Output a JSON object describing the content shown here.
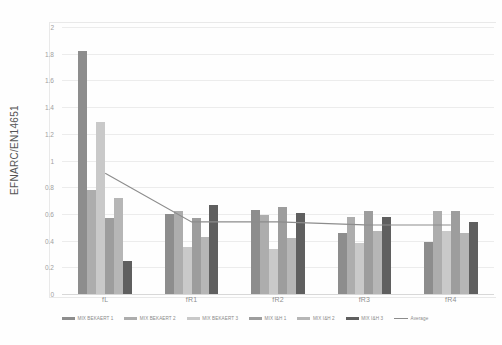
{
  "chart_data": {
    "type": "bar",
    "title": "",
    "subtitle": "",
    "xlabel": "",
    "ylabel": "EFNARC/EN14651",
    "ylim": [
      0,
      2
    ],
    "ytick_step": 0.2,
    "yticks": [
      "0",
      "0.2",
      "0.4",
      "0.6",
      "0.8",
      "1",
      "1.2",
      "1.4",
      "1.6",
      "1.8",
      "2"
    ],
    "grid": true,
    "legend_position": "bottom",
    "categories": [
      "fL",
      "fR1",
      "fR2",
      "fR3",
      "fR4"
    ],
    "series": [
      {
        "name": "MIX BEKAERT 1",
        "color": "#8d8d8d",
        "values": [
          1.82,
          0.6,
          0.63,
          0.46,
          0.39
        ]
      },
      {
        "name": "MIX BEKAERT 2",
        "color": "#adadad",
        "values": [
          0.78,
          0.62,
          0.59,
          0.58,
          0.62
        ]
      },
      {
        "name": "MIX BEKAERT 3",
        "color": "#c9c9c9",
        "values": [
          1.29,
          0.35,
          0.34,
          0.38,
          0.47
        ]
      },
      {
        "name": "MIX I&H 1",
        "color": "#9d9d9d",
        "values": [
          0.57,
          0.57,
          0.65,
          0.62,
          0.62
        ]
      },
      {
        "name": "MIX I&H 2",
        "color": "#b6b6b6",
        "values": [
          0.72,
          0.43,
          0.42,
          0.47,
          0.46
        ]
      },
      {
        "name": "MIX I&H 3",
        "color": "#5f5f5f",
        "values": [
          0.25,
          0.67,
          0.61,
          0.58,
          0.54
        ]
      }
    ],
    "line_series": {
      "name": "Average",
      "color": "#8c8c8c",
      "values": [
        0.905,
        0.54,
        0.54,
        0.518,
        0.517
      ]
    }
  }
}
